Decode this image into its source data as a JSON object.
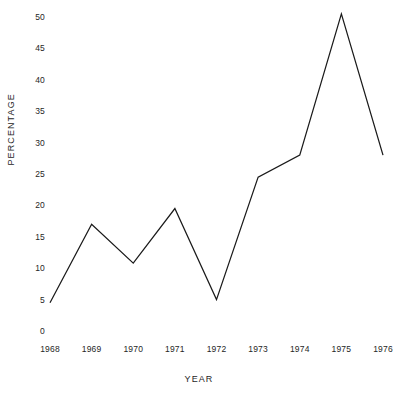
{
  "chart_data": {
    "type": "line",
    "title": "",
    "xlabel": "YEAR",
    "ylabel": "PERCENTAGE",
    "categories": [
      "1968",
      "1969",
      "1970",
      "1971",
      "1972",
      "1973",
      "1974",
      "1975",
      "1976"
    ],
    "x": [
      1968,
      1969,
      1970,
      1971,
      1972,
      1973,
      1974,
      1975,
      1976
    ],
    "values": [
      4.5,
      17.0,
      10.8,
      19.5,
      5.0,
      24.5,
      28.0,
      50.5,
      28.0
    ],
    "series": [
      {
        "name": "Percentage",
        "values": [
          4.5,
          17.0,
          10.8,
          19.5,
          5.0,
          24.5,
          28.0,
          50.5,
          28.0
        ]
      }
    ],
    "ylim": [
      0,
      50
    ],
    "xlim": [
      1968,
      1976
    ],
    "yticks": [
      0,
      5,
      10,
      15,
      20,
      25,
      30,
      35,
      40,
      45,
      50
    ],
    "ytick_labels": [
      "0",
      "5",
      "10",
      "15",
      "20",
      "25",
      "30",
      "35",
      "40",
      "45",
      "50"
    ],
    "xtick_labels": [
      "1968",
      "1969",
      "1970",
      "1971",
      "1972",
      "1973",
      "1974",
      "1975",
      "1976"
    ],
    "grid": false,
    "legend": false,
    "legend_position": "none",
    "line_color": "#1a1a1a",
    "background_color": "#ffffff",
    "markers": false,
    "annotations": []
  }
}
